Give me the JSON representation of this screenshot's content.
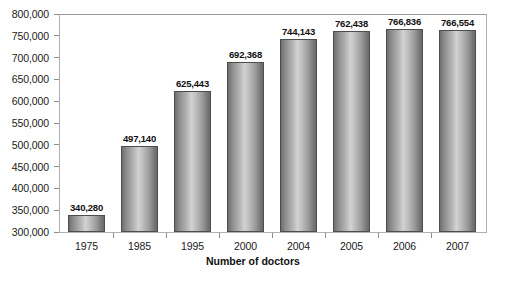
{
  "chart_data": {
    "type": "bar",
    "title": "",
    "xlabel": "Number of doctors",
    "ylabel": "",
    "categories": [
      "1975",
      "1985",
      "1995",
      "2000",
      "2004",
      "2005",
      "2006",
      "2007"
    ],
    "values": [
      340280,
      497140,
      625443,
      692368,
      744143,
      762438,
      766836,
      766554
    ],
    "value_labels": [
      "340,280",
      "497,140",
      "625,443",
      "692,368",
      "744,143",
      "762,438",
      "766,836",
      "766,554"
    ],
    "ylim": [
      300000,
      800000
    ],
    "ytick_labels": [
      "800,000",
      "750,000",
      "700,000",
      "650,000",
      "600,000",
      "550,000",
      "500,000",
      "450,000",
      "400,000",
      "350,000",
      "300,000"
    ],
    "ytick_values": [
      800000,
      750000,
      700000,
      650000,
      600000,
      550000,
      500000,
      450000,
      400000,
      350000,
      300000
    ],
    "grid": false,
    "legend": null,
    "bar_style": "cylinder-gradient-gray",
    "colors": {
      "bar_dark": "#6f6f6f",
      "bar_light": "#d2d2d2",
      "bar_outline": "#4d4d4d",
      "frame": "#b0b0b0",
      "text": "#1a1a1a",
      "background": "#ffffff"
    }
  }
}
